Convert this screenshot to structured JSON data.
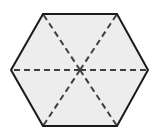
{
  "figure": {
    "name": "hexagon-with-diagonals",
    "canvas": {
      "width": 161,
      "height": 134,
      "background_color": "#ffffff"
    },
    "shape": {
      "type": "hexagon",
      "sides": 6,
      "fill_color": "#ededed",
      "outline_color": "#1a1a1a",
      "outline_width": 2,
      "center": {
        "x": 80,
        "y": 70
      },
      "vertices": [
        {
          "label": "left",
          "x": 11,
          "y": 70
        },
        {
          "label": "top-left",
          "x": 43,
          "y": 14
        },
        {
          "label": "top-right",
          "x": 117,
          "y": 14
        },
        {
          "label": "right",
          "x": 148,
          "y": 70
        },
        {
          "label": "bottom-right",
          "x": 117,
          "y": 126
        },
        {
          "label": "bottom-left",
          "x": 43,
          "y": 126
        }
      ],
      "points_attr": "11,70 43,14 117,14 148,70 117,126 43,126"
    },
    "diagonals": {
      "style": "dashed",
      "color": "#3f3f3f",
      "width": 2,
      "dash_pattern": "6,4",
      "count": 6,
      "segments": [
        {
          "name": "center-to-left",
          "x1": 80,
          "y1": 70,
          "x2": 11,
          "y2": 70
        },
        {
          "name": "center-to-top-left",
          "x1": 80,
          "y1": 70,
          "x2": 43,
          "y2": 14
        },
        {
          "name": "center-to-top-right",
          "x1": 80,
          "y1": 70,
          "x2": 117,
          "y2": 14
        },
        {
          "name": "center-to-right",
          "x1": 80,
          "y1": 70,
          "x2": 148,
          "y2": 70
        },
        {
          "name": "center-to-bottom-right",
          "x1": 80,
          "y1": 70,
          "x2": 117,
          "y2": 126
        },
        {
          "name": "center-to-bottom-left",
          "x1": 80,
          "y1": 70,
          "x2": 43,
          "y2": 126
        }
      ]
    },
    "labels": []
  }
}
